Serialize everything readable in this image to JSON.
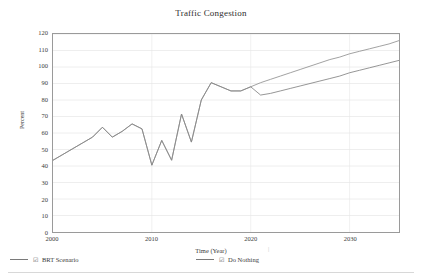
{
  "chart_data": {
    "type": "line",
    "title": "Traffic Congestion",
    "xlabel": "Time (Year)",
    "ylabel": "Percent",
    "xlim": [
      2000,
      2035
    ],
    "ylim": [
      0,
      120
    ],
    "grid": true,
    "grid_orientation": "horizontal",
    "legend_position": "bottom",
    "y_ticks": [
      0,
      10,
      20,
      30,
      40,
      50,
      60,
      70,
      80,
      90,
      100,
      110,
      120
    ],
    "x_ticks": [
      2000,
      2010,
      2020,
      2030
    ],
    "x": [
      2000,
      2001,
      2002,
      2003,
      2004,
      2005,
      2006,
      2007,
      2008,
      2009,
      2010,
      2011,
      2012,
      2013,
      2014,
      2015,
      2016,
      2017,
      2018,
      2019,
      2020,
      2021,
      2022,
      2023,
      2024,
      2025,
      2026,
      2027,
      2028,
      2029,
      2030,
      2031,
      2032,
      2033,
      2034,
      2035
    ],
    "series": [
      {
        "name": "BRT Scenario",
        "color": "#7a7a7a",
        "values": [
          43.5,
          47,
          50.5,
          54,
          57.5,
          63.5,
          57.5,
          61,
          65.5,
          62.5,
          40.5,
          55.5,
          43.5,
          71.5,
          54.5,
          80,
          90.5,
          88,
          85.5,
          85.5,
          88,
          83,
          84,
          85.5,
          87,
          88.5,
          90,
          91.5,
          93,
          94.5,
          96.5,
          98,
          99.5,
          101,
          102.5,
          104
        ]
      },
      {
        "name": "Do Nothing",
        "color": "#8a8a8a",
        "values": [
          43.5,
          47,
          50.5,
          54,
          57.5,
          63.5,
          57.5,
          61,
          65.5,
          62.5,
          40.5,
          55.5,
          43.5,
          71.5,
          54.5,
          80,
          90.5,
          88,
          85.5,
          85.5,
          88,
          90.5,
          92.5,
          94.5,
          96.5,
          98.5,
          100.5,
          102.5,
          104.5,
          106,
          108,
          109.5,
          111,
          112.5,
          114,
          116
        ]
      }
    ]
  },
  "legend": {
    "items": [
      {
        "label": "BRT Scenario",
        "check_glyph": "☑"
      },
      {
        "label": "Do Nothing",
        "check_glyph": "☑"
      }
    ]
  },
  "misc": {
    "stray_tick": "|"
  }
}
